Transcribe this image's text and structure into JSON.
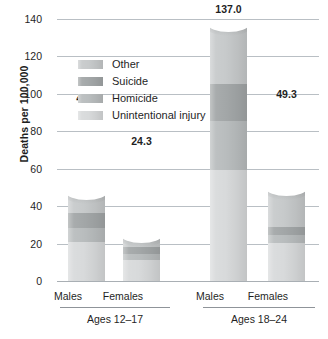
{
  "chart_data": {
    "type": "bar",
    "subtype": "stacked-bar",
    "title": "",
    "subtitle": "",
    "xlabel": "",
    "ylabel": "Deaths per 100,000",
    "ylim": [
      0,
      140
    ],
    "yticks": [
      0,
      20,
      40,
      60,
      80,
      100,
      120,
      140
    ],
    "ytick_labels": [
      "0",
      "20",
      "40",
      "60",
      "80",
      "100",
      "120",
      "140"
    ],
    "grid": "horizontal",
    "legend_position": "inside-upper-left",
    "legend_order_top_to_bottom": [
      "Other",
      "Suicide",
      "Homicide",
      "Unintentional injury"
    ],
    "stack_order_bottom_to_top": [
      "Unintentional injury",
      "Homicide",
      "Suicide",
      "Other"
    ],
    "categories": [
      "Males",
      "Females",
      "Males",
      "Females"
    ],
    "groups": [
      {
        "label": "Ages 12–17",
        "categories": [
          "Males",
          "Females"
        ]
      },
      {
        "label": "Ages 18–24",
        "categories": [
          "Males",
          "Females"
        ]
      }
    ],
    "series": [
      {
        "name": "Unintentional injury",
        "color": "#d8dadb",
        "values": [
          21.0,
          11.5,
          59.5,
          20.5
        ]
      },
      {
        "name": "Homicide",
        "color": "#b9bdbe",
        "values": [
          7.5,
          3.0,
          26.0,
          4.0
        ]
      },
      {
        "name": "Suicide",
        "color": "#a3a7a8",
        "values": [
          8.0,
          3.5,
          20.0,
          4.5
        ]
      },
      {
        "name": "Other",
        "color": "#c7cacb",
        "values": [
          10.6,
          6.3,
          31.5,
          20.3
        ]
      }
    ],
    "totals": [
      47.1,
      24.3,
      137.0,
      49.3
    ],
    "total_labels": [
      "47.1",
      "24.3",
      "137.0",
      "49.3"
    ],
    "colors": {
      "other": "#c7cacb",
      "suicide": "#a3a7a8",
      "homicide": "#b9bdbe",
      "unintentional_injury": "#d8dadb",
      "gridline": "#b9bfc4",
      "text": "#1f1f1f",
      "background": "#ffffff"
    }
  },
  "legend": {
    "items": [
      {
        "label": "Other"
      },
      {
        "label": "Suicide"
      },
      {
        "label": "Homicide"
      },
      {
        "label": "Unintentional injury"
      }
    ]
  },
  "axes": {
    "y_title": "Deaths per 100,000",
    "y_ticks": [
      "140",
      "120",
      "100",
      "80",
      "60",
      "40",
      "20",
      "0"
    ],
    "x_category_labels": [
      "Males",
      "Females",
      "Males",
      "Females"
    ],
    "x_group_labels": [
      "Ages 12–17",
      "Ages 18–24"
    ]
  },
  "bar_value_labels": [
    "47.1",
    "24.3",
    "137.0",
    "49.3"
  ]
}
